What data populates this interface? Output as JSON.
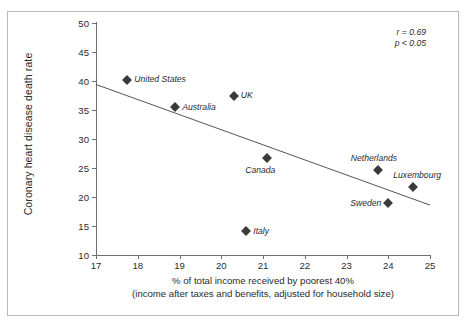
{
  "chart_data": {
    "type": "scatter",
    "title": "",
    "xlabel": "% of total income received by poorest 40%",
    "xlabel_line2": "(income after taxes and benefits, adjusted for household size)",
    "ylabel": "Coronary heart disease death rate",
    "xlim": [
      17,
      25
    ],
    "ylim": [
      10,
      50
    ],
    "xticks": [
      17,
      18,
      19,
      20,
      21,
      22,
      23,
      24,
      25
    ],
    "yticks": [
      10,
      15,
      20,
      25,
      30,
      35,
      40,
      45,
      50
    ],
    "grid": false,
    "legend": "none",
    "marker": "diamond",
    "marker_color": "#3a3a3a",
    "points": [
      {
        "label": "United States",
        "x": 17.75,
        "y": 40.2,
        "label_pos": "right"
      },
      {
        "label": "Australia",
        "x": 18.9,
        "y": 35.5,
        "label_pos": "right"
      },
      {
        "label": "UK",
        "x": 20.3,
        "y": 37.5,
        "label_pos": "right"
      },
      {
        "label": "Canada",
        "x": 21.1,
        "y": 26.7,
        "label_pos": "below-left"
      },
      {
        "label": "Italy",
        "x": 20.6,
        "y": 14.1,
        "label_pos": "right"
      },
      {
        "label": "Netherlands",
        "x": 23.75,
        "y": 24.6,
        "label_pos": "above"
      },
      {
        "label": "Luxembourg",
        "x": 24.6,
        "y": 21.8,
        "label_pos": "above-left"
      },
      {
        "label": "Sweden",
        "x": 24.0,
        "y": 18.9,
        "label_pos": "left"
      }
    ],
    "trendline": {
      "x1": 17,
      "y1": 39.4,
      "x2": 25,
      "y2": 18.6,
      "color": "#555555"
    },
    "annotations": {
      "r_value": "r = 0.69",
      "p_value": "p < 0.05"
    }
  }
}
